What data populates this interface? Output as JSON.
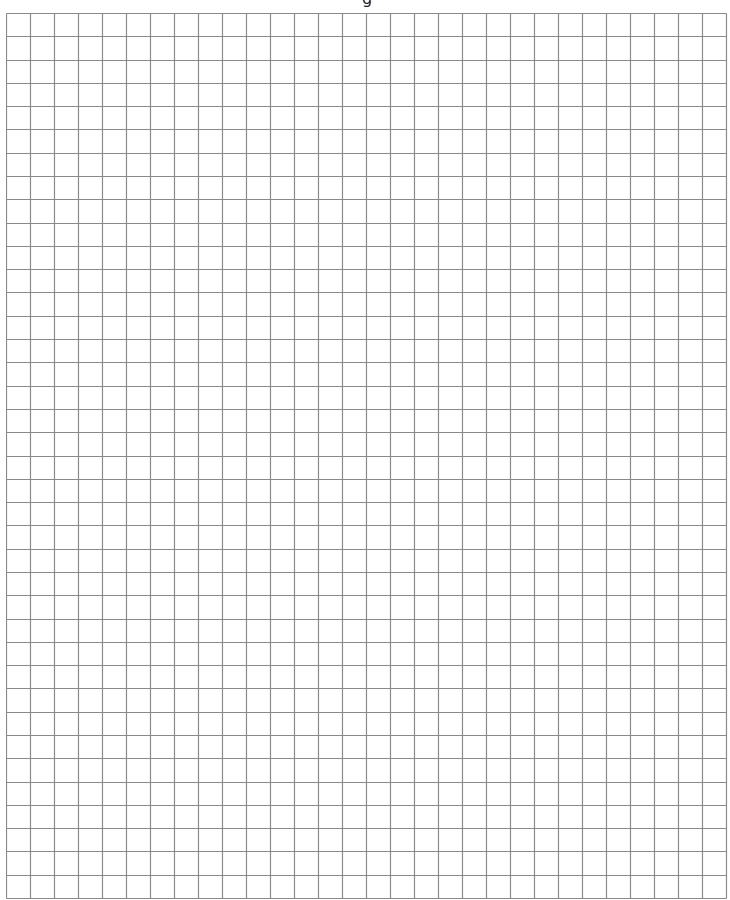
{
  "page": {
    "type": "graph-paper",
    "background_color": "#ffffff",
    "header_fragment": "g"
  },
  "grid": {
    "columns": 30,
    "rows": 38,
    "cell_width_px": 24,
    "cell_height_px": 23.29,
    "origin_x": 6,
    "origin_y": 13,
    "line_color": "#8a8a8a",
    "line_width_px": 1.2
  }
}
